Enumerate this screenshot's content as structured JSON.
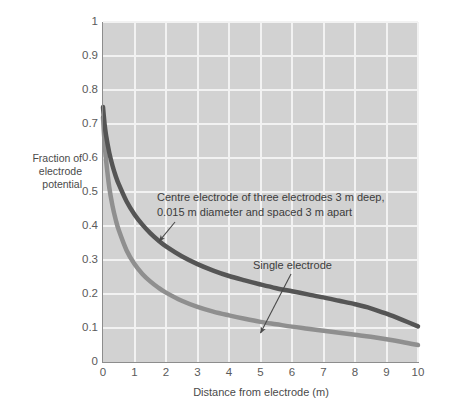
{
  "chart_data": {
    "type": "line",
    "title": "",
    "xlabel": "Distance from electrode (m)",
    "ylabel": "Fraction of electrode potential",
    "xlim": [
      0,
      10
    ],
    "ylim": [
      0,
      1
    ],
    "grid": true,
    "legend_position": "inline-annotations",
    "xticks": [
      "0",
      "1",
      "2",
      "3",
      "4",
      "5",
      "6",
      "7",
      "8",
      "9",
      "10"
    ],
    "yticks": [
      "0",
      "0.1",
      "0.2",
      "0.3",
      "0.4",
      "0.5",
      "0.6",
      "0.7",
      "0.8",
      "0.9",
      "1"
    ],
    "x": [
      0,
      0.05,
      0.1,
      0.2,
      0.3,
      0.4,
      0.5,
      0.75,
      1,
      1.25,
      1.5,
      1.75,
      2,
      2.5,
      3,
      3.5,
      4,
      4.5,
      5,
      5.5,
      6,
      6.5,
      7,
      7.5,
      8,
      8.5,
      9,
      9.5,
      10
    ],
    "series": [
      {
        "name": "Centre electrode of three electrodes 3 m deep, 0.015 m diameter and spaced 3 m apart",
        "color": "#555555",
        "values": [
          0.75,
          0.7,
          0.665,
          0.615,
          0.578,
          0.548,
          0.523,
          0.472,
          0.434,
          0.404,
          0.379,
          0.358,
          0.34,
          0.311,
          0.288,
          0.269,
          0.253,
          0.24,
          0.228,
          0.217,
          0.208,
          0.199,
          0.19,
          0.18,
          0.17,
          0.158,
          0.142,
          0.124,
          0.105
        ]
      },
      {
        "name": "Single electrode",
        "color": "#8f8f8f",
        "values": [
          0.72,
          0.645,
          0.592,
          0.513,
          0.46,
          0.42,
          0.388,
          0.328,
          0.288,
          0.259,
          0.237,
          0.219,
          0.204,
          0.18,
          0.162,
          0.148,
          0.137,
          0.127,
          0.118,
          0.111,
          0.104,
          0.098,
          0.092,
          0.086,
          0.08,
          0.074,
          0.067,
          0.059,
          0.05
        ]
      }
    ],
    "annotations": [
      {
        "id": "centre-electrode",
        "text": "Centre electrode of three electrodes 3 m deep,\n0.015 m diameter and spaced 3 m apart",
        "target_point": [
          1.78,
          0.355
        ]
      },
      {
        "id": "single-electrode",
        "text": "Single electrode",
        "target_point": [
          5.0,
          0.085
        ]
      }
    ]
  },
  "axes": {
    "x_title": "Distance from electrode (m)",
    "y_title": "Fraction of\nelectrode\npotential"
  },
  "annotations": {
    "centre": "Centre electrode of three electrodes 3 m deep,\n0.015 m diameter and spaced 3 m apart",
    "single": "Single electrode"
  },
  "colors": {
    "plot_background": "#d2d2d2",
    "gridline": "#f2f2f2",
    "axis": "#8d8d8d",
    "curve_centre": "#555555",
    "curve_single": "#8f8f8f",
    "text": "#4a4a4a",
    "page_background": "#ffffff"
  }
}
